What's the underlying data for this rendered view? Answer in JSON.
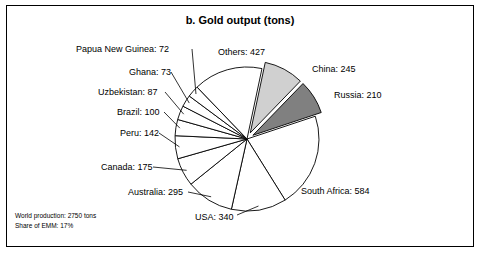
{
  "chart_data": {
    "type": "pie",
    "title": "b. Gold output (tons)",
    "unit": "tons",
    "categories": [
      "South Africa",
      "USA",
      "Australia",
      "Canada",
      "Peru",
      "Brazil",
      "Uzbekistan",
      "Ghana",
      "Papua New Guinea",
      "Others",
      "China",
      "Russia"
    ],
    "values": [
      584,
      340,
      295,
      175,
      142,
      100,
      87,
      73,
      72,
      427,
      245,
      210
    ],
    "labels": [
      "South Africa: 584",
      "USA: 340",
      "Australia: 295",
      "Canada: 175",
      "Peru: 142",
      "Brazil: 100",
      "Uzbekistan: 87",
      "Ghana: 73",
      "Papua New Guinea: 72",
      "Others: 427",
      "China: 245",
      "Russia: 210"
    ],
    "slice_colors": [
      "#ffffff",
      "#ffffff",
      "#ffffff",
      "#ffffff",
      "#ffffff",
      "#ffffff",
      "#ffffff",
      "#ffffff",
      "#ffffff",
      "#ffffff",
      "#d0d0d0",
      "#808080"
    ],
    "legend": "none",
    "grid": false,
    "notes": [
      "World production: 2750 tons",
      "Share of EMM: 17%"
    ]
  }
}
